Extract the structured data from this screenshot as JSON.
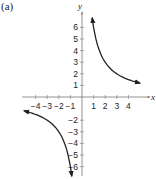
{
  "panel_label": "(a)",
  "chart_data": {
    "type": "line",
    "title": "",
    "panel_label": "(a)",
    "xlabel": "x",
    "ylabel": "y",
    "xlim": [
      -5,
      5
    ],
    "ylim": [
      -7,
      7
    ],
    "grid": false,
    "x_ticks": [
      -4,
      -3,
      -2,
      -1,
      1,
      2,
      3,
      4
    ],
    "y_ticks": [
      -6,
      -5,
      -4,
      -3,
      -2,
      1,
      2,
      3,
      4,
      5,
      6
    ],
    "x_tick_labels": [
      "−4",
      "−3",
      "−2",
      "−1",
      "1",
      "2",
      "3",
      "4"
    ],
    "y_tick_labels": [
      "−6",
      "−5",
      "−4",
      "−3",
      "−2",
      "1",
      "2",
      "3",
      "4",
      "5",
      "6"
    ],
    "note": "Curve shape fitted to y = 6/x; no equation appears in the image. Sampled points are estimates read from the plot.",
    "series": [
      {
        "name": "branch-quadrant-I",
        "x": [
          1.3,
          1.5,
          2,
          2.5,
          3,
          3.5,
          4,
          4.5,
          5
        ],
        "y": [
          4.6,
          4.0,
          3.0,
          2.4,
          2.0,
          1.71,
          1.5,
          1.33,
          1.2
        ],
        "arrows": "both-ends"
      },
      {
        "name": "branch-quadrant-III",
        "x": [
          -5,
          -4.5,
          -4,
          -3.5,
          -3,
          -2.5,
          -2,
          -1.5,
          -1.3
        ],
        "y": [
          -1.2,
          -1.33,
          -1.5,
          -1.71,
          -2.0,
          -2.4,
          -3.0,
          -4.0,
          -4.6
        ],
        "arrows": "both-ends"
      }
    ]
  }
}
